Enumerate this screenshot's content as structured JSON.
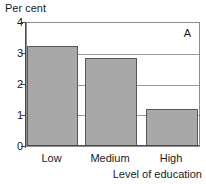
{
  "chart_data": {
    "type": "bar",
    "title": "",
    "panel_label": "A",
    "categories": [
      "Low",
      "Medium",
      "High"
    ],
    "values": [
      3.25,
      2.85,
      1.2
    ],
    "xlabel": "Level of education",
    "ylabel": "Per cent",
    "ylim": [
      0,
      4
    ],
    "yticks": [
      "0",
      "1",
      "2",
      "3",
      "4"
    ],
    "ytick_values": [
      0,
      1,
      2,
      3,
      4
    ],
    "grid": true,
    "legend": "none",
    "bar_color": "#a8a8a8",
    "bar_border_color": "#585858"
  },
  "axis": {
    "y_title": "Per cent",
    "x_title": "Level of education",
    "tick_0": "0",
    "tick_1": "1",
    "tick_2": "2",
    "tick_3": "3",
    "tick_4": "4"
  },
  "categories": {
    "low": "Low",
    "medium": "Medium",
    "high": "High"
  },
  "panel": {
    "label": "A"
  }
}
